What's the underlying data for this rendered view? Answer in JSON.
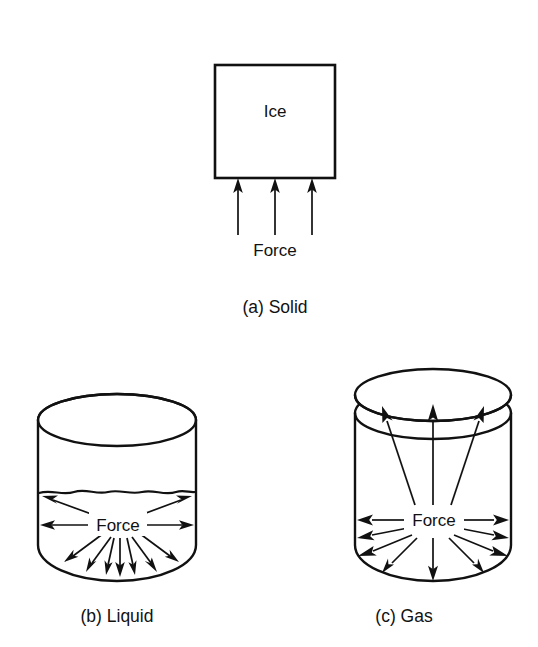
{
  "figure": {
    "background_color": "#ffffff",
    "line_color": "#111111",
    "panels": [
      {
        "id": "solid",
        "caption": "(a) Solid",
        "substance_label": "Ice",
        "force_label": "Force",
        "shape": "square",
        "arrow_count": 3,
        "arrow_direction": "up",
        "arrow_origin": "external-bottom"
      },
      {
        "id": "liquid",
        "caption": "(b) Liquid",
        "substance_label": "",
        "force_label": "Force",
        "shape": "open-cylinder",
        "arrow_count": 11,
        "arrow_direction": "radial-outward",
        "arrow_origin": "internal-center",
        "has_free_surface": true
      },
      {
        "id": "gas",
        "caption": "(c) Gas",
        "substance_label": "",
        "force_label": "Force",
        "shape": "lidded-cylinder",
        "arrow_count": 13,
        "arrow_direction": "radial-outward",
        "arrow_origin": "internal-center",
        "has_free_surface": false
      }
    ]
  }
}
